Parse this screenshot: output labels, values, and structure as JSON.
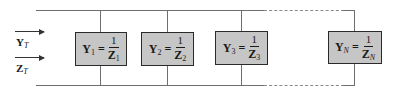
{
  "diagram": {
    "type": "parallel-admittance-network",
    "inputs": [
      {
        "symbol": "Y",
        "subscript": "T",
        "role": "total-admittance"
      },
      {
        "symbol": "Z",
        "subscript": "T",
        "role": "total-impedance"
      }
    ],
    "branches": [
      {
        "y_symbol": "Y",
        "y_sub": "1",
        "eq": "=",
        "num": "1",
        "z_symbol": "Z",
        "z_sub": "1"
      },
      {
        "y_symbol": "Y",
        "y_sub": "2",
        "eq": "=",
        "num": "1",
        "z_symbol": "Z",
        "z_sub": "2"
      },
      {
        "y_symbol": "Y",
        "y_sub": "3",
        "eq": "=",
        "num": "1",
        "z_symbol": "Z",
        "z_sub": "3"
      },
      {
        "y_symbol": "Y",
        "y_sub": "N",
        "eq": "=",
        "num": "1",
        "z_symbol": "Z",
        "z_sub": "N"
      }
    ],
    "colors": {
      "box_fill": "#c6c6c6",
      "box_border": "#2a2a2a",
      "wire": "#6e6e6e"
    }
  }
}
